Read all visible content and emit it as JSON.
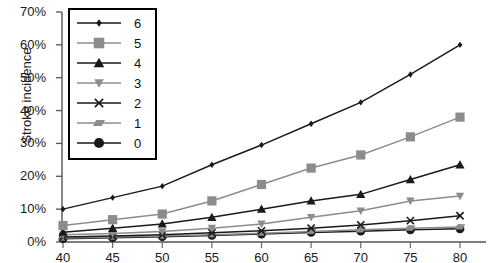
{
  "chart_data": {
    "type": "line",
    "title": "",
    "xlabel": "",
    "ylabel": "Stroke incidence",
    "x": [
      40,
      45,
      50,
      55,
      60,
      65,
      70,
      75,
      80
    ],
    "xtick_labels": [
      "40",
      "45",
      "50",
      "55",
      "60",
      "65",
      "70",
      "75",
      "80"
    ],
    "ytick_labels": [
      "0%",
      "10%",
      "20%",
      "30%",
      "40%",
      "50%",
      "60%",
      "70%"
    ],
    "ytick_values": [
      0,
      10,
      20,
      30,
      40,
      50,
      60,
      70
    ],
    "xlim": [
      40,
      80
    ],
    "ylim": [
      0,
      70
    ],
    "grid": false,
    "legend_position": "upper-left-inset",
    "series": [
      {
        "name": "6",
        "label": "6",
        "marker": "diamond",
        "color": "#1a1a1a",
        "values": [
          10.0,
          13.5,
          17.0,
          23.5,
          29.5,
          36.0,
          42.5,
          51.0,
          60.0
        ]
      },
      {
        "name": "5",
        "label": "5",
        "marker": "square",
        "color": "#8c8c8c",
        "values": [
          5.0,
          6.8,
          8.5,
          12.5,
          17.5,
          22.5,
          26.5,
          32.0,
          38.0
        ]
      },
      {
        "name": "4",
        "label": "4",
        "marker": "triangle-up",
        "color": "#1a1a1a",
        "values": [
          3.0,
          4.2,
          5.5,
          7.5,
          10.0,
          12.5,
          14.5,
          19.0,
          23.5
        ]
      },
      {
        "name": "3",
        "label": "3",
        "marker": "triangle-down",
        "color": "#8c8c8c",
        "values": [
          2.2,
          2.6,
          3.2,
          4.2,
          5.5,
          7.5,
          9.5,
          12.5,
          14.0
        ]
      },
      {
        "name": "2",
        "label": "2",
        "marker": "cross",
        "color": "#1a1a1a",
        "values": [
          1.5,
          1.8,
          2.2,
          2.8,
          3.4,
          4.2,
          5.2,
          6.5,
          8.0
        ]
      },
      {
        "name": "1",
        "label": "1",
        "marker": "parallelogram",
        "color": "#8c8c8c",
        "values": [
          1.2,
          1.5,
          1.8,
          2.2,
          2.7,
          3.2,
          3.7,
          4.2,
          4.6
        ]
      },
      {
        "name": "0",
        "label": "0",
        "marker": "circle",
        "color": "#1a1a1a",
        "values": [
          1.0,
          1.3,
          1.6,
          2.0,
          2.4,
          2.9,
          3.3,
          3.7,
          4.0
        ]
      }
    ]
  }
}
